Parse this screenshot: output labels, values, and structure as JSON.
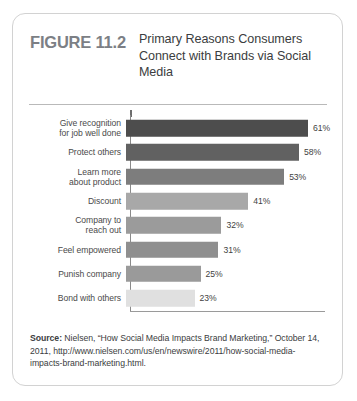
{
  "figure": {
    "number": "FIGURE 11.2",
    "title": "Primary Reasons Consumers Connect with Brands via Social Media"
  },
  "chart_data": {
    "type": "bar",
    "orientation": "horizontal",
    "title": "Primary Reasons Consumers Connect with Brands via Social Media",
    "xlabel": "",
    "ylabel": "",
    "xlim": [
      0,
      61
    ],
    "grid": false,
    "legend": "none",
    "categories": [
      "Give recognition for job well done",
      "Protect others",
      "Learn more about product",
      "Discount",
      "Company to reach out",
      "Feel empowered",
      "Punish company",
      "Bond with others"
    ],
    "values": [
      61,
      58,
      53,
      41,
      32,
      31,
      25,
      23
    ],
    "value_labels": [
      "61%",
      "58%",
      "53%",
      "41%",
      "32%",
      "31%",
      "25%",
      "23%"
    ],
    "bar_colors": [
      "#4d4d4d",
      "#616161",
      "#7d7d7d",
      "#a8a8a8",
      "#9b9b9b",
      "#8f8f8f",
      "#9a9a9a",
      "#e0e0e0"
    ],
    "bars": [
      {
        "label_lines": [
          "Give recognition",
          "for job well done"
        ],
        "value": 61,
        "value_label": "61%",
        "color": "#4d4d4d"
      },
      {
        "label_lines": [
          "Protect others"
        ],
        "value": 58,
        "value_label": "58%",
        "color": "#616161"
      },
      {
        "label_lines": [
          "Learn more",
          "about product"
        ],
        "value": 53,
        "value_label": "53%",
        "color": "#7d7d7d"
      },
      {
        "label_lines": [
          "Discount"
        ],
        "value": 41,
        "value_label": "41%",
        "color": "#a8a8a8"
      },
      {
        "label_lines": [
          "Company to",
          "reach out"
        ],
        "value": 32,
        "value_label": "32%",
        "color": "#9b9b9b"
      },
      {
        "label_lines": [
          "Feel empowered"
        ],
        "value": 31,
        "value_label": "31%",
        "color": "#8f8f8f"
      },
      {
        "label_lines": [
          "Punish company"
        ],
        "value": 25,
        "value_label": "25%",
        "color": "#9a9a9a"
      },
      {
        "label_lines": [
          "Bond with others"
        ],
        "value": 23,
        "value_label": "23%",
        "color": "#e0e0e0"
      }
    ]
  },
  "source": {
    "label": "Source:",
    "text": " Nielsen, “How Social Media Impacts Brand Marketing,” October 14, 2011, http://www.nielsen.com/us/en/newswire/2011/how-social-media-impacts-brand-marketing.html."
  }
}
